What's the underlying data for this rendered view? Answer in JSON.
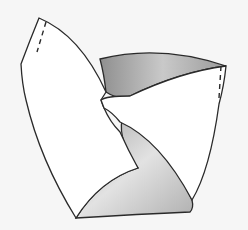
{
  "figure": {
    "colors": {
      "background": "#f6f6f6",
      "paper": "#ffffff",
      "outline": "#2a2a2a",
      "shade_light": "#d8d8d8",
      "shade_dark": "#9a9a9a"
    }
  }
}
